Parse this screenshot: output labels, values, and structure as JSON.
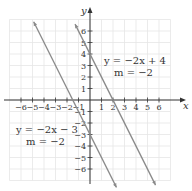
{
  "chart_data": {
    "type": "line",
    "title": "",
    "xlabel": "x",
    "ylabel": "y",
    "xlim": [
      -6.5,
      7.5
    ],
    "ylim": [
      -7,
      7.5
    ],
    "grid": true,
    "x_ticks": [
      -6,
      -5,
      -4,
      -3,
      -2,
      -1,
      1,
      2,
      3,
      4,
      5,
      6
    ],
    "y_ticks": [
      -6,
      -5,
      -4,
      -3,
      -2,
      -1,
      1,
      2,
      3,
      4,
      5,
      6
    ],
    "x_tick_labels": [
      "−6",
      "−5",
      "−4",
      "−3",
      "−2",
      "−1",
      "1",
      "2",
      "3",
      "4",
      "5",
      "6"
    ],
    "y_tick_labels": [
      "−6",
      "−5",
      "−4",
      "−3",
      "−2",
      "−1",
      "1",
      "2",
      "3",
      "4",
      "5",
      "6"
    ],
    "series": [
      {
        "name": "y = −2x + 4",
        "slope": -2,
        "intercept": 4,
        "x": [
          -1.3,
          5.7
        ],
        "y": [
          6.6,
          -7.4
        ],
        "annotation": [
          "y = −2x + 4",
          "m = −2"
        ],
        "color": "#8a8a8a"
      },
      {
        "name": "y = −2x − 3",
        "slope": -2,
        "intercept": -3,
        "x": [
          -4.9,
          2.3
        ],
        "y": [
          6.8,
          -7.6
        ],
        "annotation": [
          "y = −2x − 3",
          "m = −2"
        ],
        "color": "#8a8a8a"
      }
    ]
  },
  "labels": {
    "x_axis": "x",
    "y_axis": "y",
    "line1_eq": "y = −2x + 4",
    "line1_slope": "m = −2",
    "line2_eq": "y = −2x − 3",
    "line2_slope": "m = −2"
  }
}
